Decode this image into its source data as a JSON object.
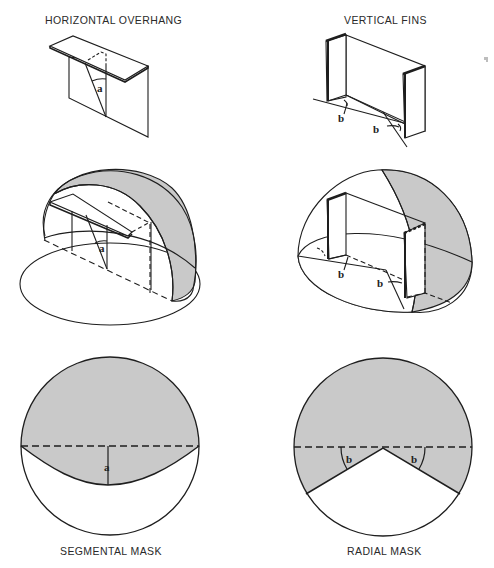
{
  "figure": {
    "panels": [
      {
        "id": "horizontal-overhang",
        "title": "HORIZONTAL OVERHANG",
        "angle_label": "a",
        "view": "perspective"
      },
      {
        "id": "vertical-fins",
        "title": "VERTICAL FINS",
        "angle_label": "b",
        "view": "perspective"
      },
      {
        "id": "overhang-sky-dome",
        "angle_label": "a",
        "view": "sky-dome"
      },
      {
        "id": "fins-sky-dome",
        "angle_label": "b",
        "view": "sky-dome"
      },
      {
        "id": "segmental-mask",
        "title": "SEGMENTAL MASK",
        "angle_label": "a",
        "view": "plan-mask"
      },
      {
        "id": "radial-mask",
        "title": "RADIAL MASK",
        "angle_label": "b",
        "view": "plan-mask"
      }
    ],
    "labels": {
      "top_left": "HORIZONTAL OVERHANG",
      "top_right": "VERTICAL FINS",
      "bottom_left": "SEGMENTAL MASK",
      "bottom_right": "RADIAL MASK",
      "angle_a": "a",
      "angle_b": "b"
    },
    "colors": {
      "shade": "#c9c9c9",
      "line": "#1e1e1e",
      "background": "#ffffff"
    }
  }
}
